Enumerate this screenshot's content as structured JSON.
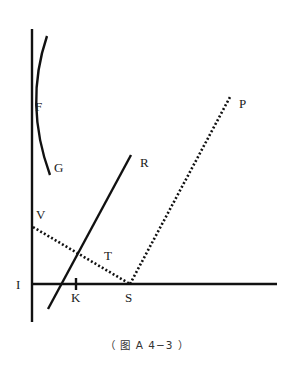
{
  "figure": {
    "caption": "（ 图 A 4−3 ）",
    "labels": {
      "F": "F",
      "G": "G",
      "R": "R",
      "P": "P",
      "V": "V",
      "T": "T",
      "I": "I",
      "K": "K",
      "S": "S"
    },
    "elements": [
      {
        "id": "vertical-axis",
        "style": "solid",
        "from": [
          32,
          29
        ],
        "to": [
          32,
          322
        ]
      },
      {
        "id": "horizontal-axis",
        "style": "solid",
        "from": [
          32,
          284
        ],
        "to": [
          277,
          284
        ]
      },
      {
        "id": "mirror-arc-FG",
        "style": "solid",
        "from": [
          47,
          36
        ],
        "through": [
          32,
          110
        ],
        "to": [
          50,
          175
        ]
      },
      {
        "id": "line-R",
        "style": "solid",
        "from": [
          48,
          309
        ],
        "to": [
          131,
          155
        ]
      },
      {
        "id": "ray-VS",
        "style": "dotted",
        "from": [
          33,
          227
        ],
        "to": [
          130,
          284
        ]
      },
      {
        "id": "ray-SP",
        "style": "dotted",
        "from": [
          130,
          284
        ],
        "to": [
          230,
          97
        ]
      },
      {
        "id": "tick-K",
        "style": "solid",
        "at": [
          76,
          284
        ]
      }
    ],
    "colors": {
      "line": "#111111",
      "background": "#ffffff"
    }
  }
}
